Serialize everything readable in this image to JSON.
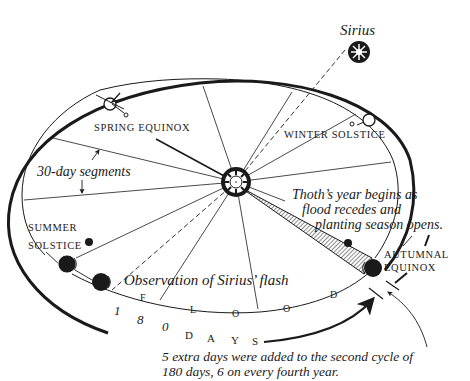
{
  "diagram": {
    "title_star": "Sirius",
    "labels": {
      "spring_equinox": "SPRING EQUINOX",
      "winter_solstice": "WINTER SOLSTICE",
      "summer_solstice_line1": "SUMMER",
      "summer_solstice_line2": "SOLSTICE",
      "autumnal_equinox_line1": "AUTUMNAL",
      "autumnal_equinox_line2": "EQUINOX",
      "segments": "30-day segments",
      "observation": "Observation of Sirius’ flash"
    },
    "thoth_note": {
      "line1": "Thoth’s year begins as",
      "line2": "flood recedes and",
      "line3": "planting season opens."
    },
    "flood_letters": [
      "F",
      "L",
      "O",
      "O",
      "D"
    ],
    "days_letters": [
      "1",
      "8",
      "0",
      "D",
      "A",
      "Y",
      "S"
    ],
    "footnote": {
      "line1": "5 extra days were added to the second cycle of",
      "line2": "180 days, 6 on every fourth year."
    },
    "colors": {
      "ink": "#1a1a1a",
      "paper": "#ffffff"
    }
  }
}
